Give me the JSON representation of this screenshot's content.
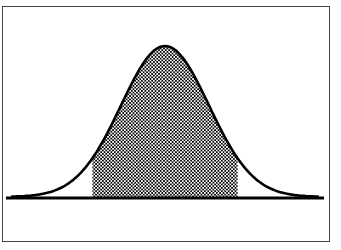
{
  "chart_data": {
    "type": "area",
    "title": "",
    "xlabel": "",
    "ylabel": "",
    "distribution": "normal",
    "mean": 0,
    "std": 1,
    "shaded_region": {
      "lower": -1.65,
      "upper": 1.65
    },
    "x_window": [
      -3.5,
      3.5
    ],
    "grid": false,
    "legend": false,
    "colors": {
      "curve": "#000000",
      "shade": "#000000",
      "background": "#ffffff",
      "frame": "#444444"
    }
  },
  "screen": {
    "frame_color": "#444444"
  }
}
